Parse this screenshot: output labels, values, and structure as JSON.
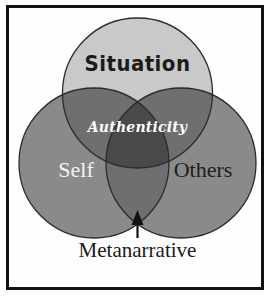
{
  "figure": {
    "type": "venn-diagram-3-set",
    "background_color": "#ffffff",
    "frame_color": "#111111"
  },
  "sets": [
    {
      "id": "situation",
      "label": "Situation",
      "position": "top",
      "fill_color": "#c9c9c9",
      "label_color": "#1b1b1b"
    },
    {
      "id": "self",
      "label": "Self",
      "position": "bottom-left",
      "fill_color": "#8a8a8a",
      "label_color": "#f2f2f2"
    },
    {
      "id": "others",
      "label": "Others",
      "position": "bottom-right",
      "fill_color": "#8a8a8a",
      "label_color": "#1d1d1d"
    }
  ],
  "intersections": {
    "center_label": "Authenticity",
    "center_label_color": "#fdfdfd",
    "pair_fill_color": "#6f6f6f",
    "triple_fill_color": "#4a4a4a"
  },
  "annotation": {
    "label": "Metanarrative",
    "label_color": "#1a1a1a",
    "pointer": "up-arrow",
    "points_to": "triple-intersection"
  },
  "caption": {
    "sliver_text": ""
  }
}
